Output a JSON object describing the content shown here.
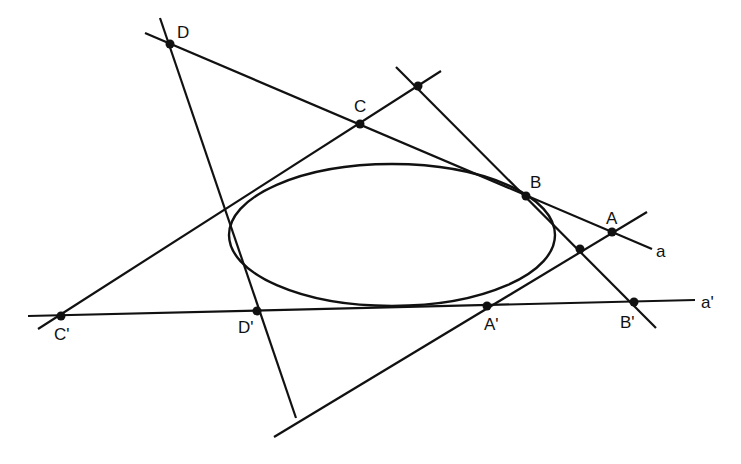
{
  "figure": {
    "colors": {
      "ink": "#111111",
      "background": "#ffffff"
    },
    "labels": {
      "D": "D",
      "C": "C",
      "B": "B",
      "A": "A",
      "a": "a",
      "a_prime": "a'",
      "A_prime": "A'",
      "B_prime": "B'",
      "C_prime": "C'",
      "D_prime": "D'"
    },
    "points": {
      "D": [
        170,
        44
      ],
      "C": [
        360,
        124
      ],
      "B": [
        526,
        196
      ],
      "A": [
        612,
        232
      ],
      "C_prime": [
        61,
        316
      ],
      "D_prime": [
        257,
        311
      ],
      "A_prime": [
        487,
        306
      ],
      "B_prime": [
        634,
        302
      ],
      "top_intersection": [
        418,
        86
      ],
      "right_intersection": [
        580,
        249
      ]
    },
    "lines": {
      "a": [
        [
          145,
          33
        ],
        [
          652,
          249
        ]
      ],
      "a_prime": [
        [
          28,
          316
        ],
        [
          695,
          300
        ]
      ],
      "DD_prime": [
        [
          160,
          18
        ],
        [
          296,
          418
        ]
      ],
      "C_primeC": [
        [
          38,
          329
        ],
        [
          441,
          71
        ]
      ],
      "BB_prime": [
        [
          396,
          67
        ],
        [
          656,
          328
        ]
      ],
      "A_primeA": [
        [
          274,
          437
        ],
        [
          647,
          212
        ]
      ]
    },
    "ellipse": {
      "cx": 392,
      "cy": 235,
      "rx": 163,
      "ry": 71
    }
  },
  "caption": {
    "text": ""
  }
}
